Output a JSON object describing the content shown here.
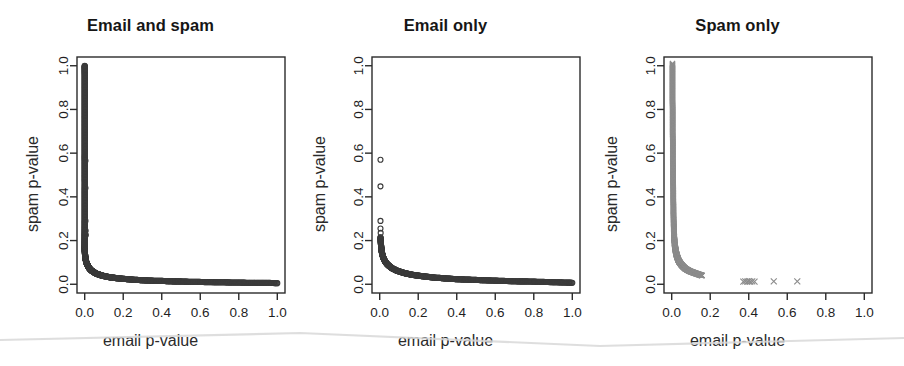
{
  "figure": {
    "width": 904,
    "height": 366,
    "background": "#ffffff",
    "panel_count": 3
  },
  "chart_data": [
    {
      "type": "scatter",
      "title": "Email and spam",
      "xlabel": "email p-value",
      "ylabel": "spam p-value",
      "xlim": [
        -0.04,
        1.04
      ],
      "ylim": [
        -0.04,
        1.04
      ],
      "xticks": [
        0.0,
        0.2,
        0.4,
        0.6,
        0.8,
        1.0
      ],
      "yticks": [
        0.0,
        0.2,
        0.4,
        0.6,
        0.8,
        1.0
      ],
      "xticklabels": [
        "0.0",
        "0.2",
        "0.4",
        "0.6",
        "0.8",
        "1.0"
      ],
      "yticklabels": [
        "0.0",
        "0.2",
        "0.4",
        "0.6",
        "0.8",
        "1.0"
      ],
      "grid": false,
      "legend": "none",
      "marker": "open-circle",
      "marker_color": "#3b3b3b",
      "series": [
        {
          "name": "email and spam",
          "x": [
            0.0,
            0.0,
            0.0,
            0.0,
            0.0,
            0.0,
            0.0,
            0.0,
            0.0,
            0.0,
            0.0,
            0.0,
            0.0,
            0.0,
            0.0,
            0.0,
            0.0,
            0.0,
            0.0,
            0.0,
            0.0,
            0.0,
            0.0,
            0.0,
            0.0,
            0.0,
            0.0,
            0.0,
            0.0,
            0.0,
            0.0,
            0.0,
            0.0,
            0.0,
            0.0,
            0.0,
            0.0,
            0.0,
            0.0,
            0.0,
            0.001,
            0.001,
            0.002,
            0.002,
            0.003,
            0.004,
            0.005,
            0.006,
            0.007,
            0.008,
            0.01,
            0.012,
            0.014,
            0.016,
            0.018,
            0.021,
            0.024,
            0.027,
            0.031,
            0.035,
            0.04,
            0.045,
            0.05,
            0.056,
            0.062,
            0.069,
            0.077,
            0.085,
            0.094,
            0.104,
            0.115,
            0.126,
            0.138,
            0.151,
            0.165,
            0.18,
            0.196,
            0.213,
            0.231,
            0.25,
            0.27,
            0.291,
            0.313,
            0.336,
            0.36,
            0.385,
            0.411,
            0.438,
            0.466,
            0.495,
            0.525,
            0.556,
            0.588,
            0.621,
            0.655,
            0.69,
            0.726,
            0.763,
            0.801,
            0.84,
            0.88,
            0.921,
            0.963,
            1.0
          ],
          "y": [
            1.0,
            0.985,
            0.965,
            0.94,
            0.915,
            0.89,
            0.865,
            0.84,
            0.815,
            0.79,
            0.765,
            0.74,
            0.715,
            0.69,
            0.665,
            0.64,
            0.615,
            0.59,
            0.57,
            0.545,
            0.52,
            0.495,
            0.47,
            0.44,
            0.415,
            0.39,
            0.365,
            0.34,
            0.315,
            0.29,
            0.27,
            0.25,
            0.232,
            0.218,
            0.205,
            0.193,
            0.182,
            0.172,
            0.163,
            0.155,
            0.148,
            0.141,
            0.135,
            0.129,
            0.124,
            0.119,
            0.114,
            0.11,
            0.105,
            0.101,
            0.097,
            0.093,
            0.089,
            0.085,
            0.081,
            0.077,
            0.073,
            0.07,
            0.066,
            0.063,
            0.06,
            0.057,
            0.054,
            0.051,
            0.048,
            0.046,
            0.044,
            0.041,
            0.039,
            0.037,
            0.035,
            0.033,
            0.031,
            0.03,
            0.028,
            0.027,
            0.025,
            0.024,
            0.023,
            0.021,
            0.02,
            0.019,
            0.018,
            0.017,
            0.016,
            0.016,
            0.015,
            0.014,
            0.013,
            0.013,
            0.012,
            0.011,
            0.011,
            0.01,
            0.01,
            0.009,
            0.009,
            0.008,
            0.008,
            0.007,
            0.007,
            0.006,
            0.006,
            0.005
          ]
        }
      ],
      "isolated_points": [
        {
          "x": 0.004,
          "y": 0.565
        },
        {
          "x": 0.004,
          "y": 0.44
        },
        {
          "x": 0.004,
          "y": 0.29
        },
        {
          "x": 0.005,
          "y": 0.245
        },
        {
          "x": 0.006,
          "y": 0.225
        }
      ]
    },
    {
      "type": "scatter",
      "title": "Email only",
      "xlabel": "email p-value",
      "ylabel": "spam p-value",
      "xlim": [
        -0.04,
        1.04
      ],
      "ylim": [
        -0.04,
        1.04
      ],
      "xticks": [
        0.0,
        0.2,
        0.4,
        0.6,
        0.8,
        1.0
      ],
      "yticks": [
        0.0,
        0.2,
        0.4,
        0.6,
        0.8,
        1.0
      ],
      "xticklabels": [
        "0.0",
        "0.2",
        "0.4",
        "0.6",
        "0.8",
        "1.0"
      ],
      "yticklabels": [
        "0.0",
        "0.2",
        "0.4",
        "0.6",
        "0.8",
        "1.0"
      ],
      "grid": false,
      "legend": "none",
      "marker": "open-circle",
      "marker_color": "#3b3b3b",
      "series": [
        {
          "name": "email only",
          "x": [
            0.004,
            0.005,
            0.006,
            0.007,
            0.008,
            0.009,
            0.01,
            0.012,
            0.014,
            0.016,
            0.018,
            0.021,
            0.024,
            0.027,
            0.031,
            0.035,
            0.04,
            0.045,
            0.05,
            0.056,
            0.062,
            0.069,
            0.077,
            0.085,
            0.094,
            0.104,
            0.115,
            0.126,
            0.138,
            0.151,
            0.165,
            0.18,
            0.196,
            0.213,
            0.231,
            0.25,
            0.27,
            0.291,
            0.313,
            0.336,
            0.36,
            0.385,
            0.411,
            0.438,
            0.466,
            0.495,
            0.525,
            0.556,
            0.588,
            0.621,
            0.655,
            0.69,
            0.726,
            0.763,
            0.801,
            0.84,
            0.88,
            0.921,
            0.963,
            1.0
          ],
          "y": [
            0.215,
            0.2,
            0.188,
            0.178,
            0.168,
            0.16,
            0.152,
            0.143,
            0.136,
            0.129,
            0.123,
            0.117,
            0.111,
            0.106,
            0.101,
            0.096,
            0.091,
            0.087,
            0.083,
            0.079,
            0.075,
            0.071,
            0.068,
            0.064,
            0.061,
            0.058,
            0.055,
            0.052,
            0.049,
            0.047,
            0.044,
            0.042,
            0.04,
            0.038,
            0.036,
            0.034,
            0.032,
            0.03,
            0.029,
            0.027,
            0.026,
            0.024,
            0.023,
            0.022,
            0.021,
            0.02,
            0.019,
            0.018,
            0.017,
            0.016,
            0.015,
            0.014,
            0.013,
            0.013,
            0.012,
            0.011,
            0.01,
            0.009,
            0.008,
            0.007
          ]
        }
      ],
      "isolated_points": [
        {
          "x": 0.004,
          "y": 0.57
        },
        {
          "x": 0.004,
          "y": 0.448
        },
        {
          "x": 0.004,
          "y": 0.29
        },
        {
          "x": 0.004,
          "y": 0.255
        },
        {
          "x": 0.005,
          "y": 0.235
        }
      ]
    },
    {
      "type": "scatter",
      "title": "Spam only",
      "xlabel": "email p-value",
      "ylabel": "spam p-value",
      "xlim": [
        -0.04,
        1.04
      ],
      "ylim": [
        -0.04,
        1.04
      ],
      "xticks": [
        0.0,
        0.2,
        0.4,
        0.6,
        0.8,
        1.0
      ],
      "yticks": [
        0.0,
        0.2,
        0.4,
        0.6,
        0.8,
        1.0
      ],
      "xticklabels": [
        "0.0",
        "0.2",
        "0.4",
        "0.6",
        "0.8",
        "1.0"
      ],
      "yticklabels": [
        "0.0",
        "0.2",
        "0.4",
        "0.6",
        "0.8",
        "1.0"
      ],
      "grid": false,
      "legend": "none",
      "marker": "cross",
      "marker_color": "#8c8c8c",
      "series": [
        {
          "name": "spam only",
          "x": [
            0.004,
            0.004,
            0.004,
            0.004,
            0.004,
            0.004,
            0.004,
            0.004,
            0.005,
            0.005,
            0.005,
            0.005,
            0.005,
            0.005,
            0.006,
            0.006,
            0.006,
            0.006,
            0.006,
            0.007,
            0.007,
            0.007,
            0.007,
            0.008,
            0.008,
            0.008,
            0.009,
            0.009,
            0.009,
            0.01,
            0.01,
            0.011,
            0.011,
            0.012,
            0.012,
            0.013,
            0.013,
            0.014,
            0.015,
            0.015,
            0.016,
            0.017,
            0.018,
            0.019,
            0.02,
            0.021,
            0.022,
            0.023,
            0.025,
            0.026,
            0.028,
            0.03,
            0.032,
            0.034,
            0.037,
            0.04,
            0.044,
            0.048,
            0.053,
            0.058,
            0.064,
            0.07,
            0.077,
            0.085,
            0.093,
            0.102,
            0.111,
            0.12,
            0.13,
            0.14,
            0.15,
            0.158
          ],
          "y": [
            1.01,
            0.985,
            0.96,
            0.935,
            0.91,
            0.885,
            0.86,
            0.835,
            0.81,
            0.785,
            0.76,
            0.735,
            0.71,
            0.685,
            0.66,
            0.635,
            0.61,
            0.585,
            0.56,
            0.535,
            0.51,
            0.485,
            0.46,
            0.435,
            0.41,
            0.385,
            0.36,
            0.34,
            0.32,
            0.3,
            0.282,
            0.266,
            0.252,
            0.24,
            0.229,
            0.219,
            0.21,
            0.202,
            0.194,
            0.187,
            0.18,
            0.174,
            0.168,
            0.162,
            0.157,
            0.152,
            0.147,
            0.142,
            0.137,
            0.132,
            0.127,
            0.122,
            0.117,
            0.112,
            0.107,
            0.102,
            0.097,
            0.092,
            0.087,
            0.082,
            0.077,
            0.072,
            0.068,
            0.064,
            0.06,
            0.057,
            0.054,
            0.051,
            0.048,
            0.045,
            0.042,
            0.04
          ]
        }
      ],
      "outlier_points": [
        {
          "x": 0.372,
          "y": 0.012
        },
        {
          "x": 0.382,
          "y": 0.013
        },
        {
          "x": 0.392,
          "y": 0.012
        },
        {
          "x": 0.4,
          "y": 0.014
        },
        {
          "x": 0.408,
          "y": 0.012
        },
        {
          "x": 0.418,
          "y": 0.013
        },
        {
          "x": 0.43,
          "y": 0.012
        },
        {
          "x": 0.53,
          "y": 0.013
        },
        {
          "x": 0.652,
          "y": 0.013
        }
      ]
    }
  ],
  "artifacts": {
    "scanline_description": "faint diagonal scanner seam across lower portion",
    "scanline_color": "#d8d8d8"
  }
}
